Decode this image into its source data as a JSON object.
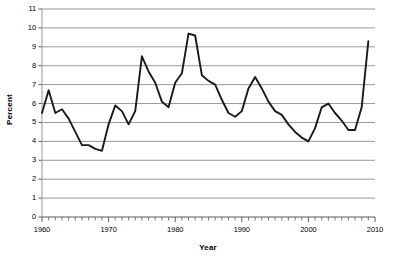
{
  "chart_data": {
    "type": "line",
    "title": "",
    "xlabel": "Year",
    "ylabel": "Percent",
    "xlim": [
      1960,
      2010
    ],
    "ylim": [
      0,
      11
    ],
    "grid": "horizontal",
    "legend": "none",
    "x_tick_labels": [
      "1960",
      "1970",
      "1980",
      "1990",
      "2000",
      "2010"
    ],
    "x_tick_values": [
      1960,
      1970,
      1980,
      1990,
      2000,
      2010
    ],
    "x_minor_tick_step": 1,
    "y_tick_labels": [
      "0",
      "1",
      "2",
      "3",
      "4",
      "5",
      "6",
      "7",
      "8",
      "9",
      "10",
      "11"
    ],
    "y_tick_values": [
      0,
      1,
      2,
      3,
      4,
      5,
      6,
      7,
      8,
      9,
      10,
      11
    ],
    "series": [
      {
        "name": "Percent",
        "color": "#1a1a1a",
        "x": [
          1960,
          1961,
          1962,
          1963,
          1964,
          1965,
          1966,
          1967,
          1968,
          1969,
          1970,
          1971,
          1972,
          1973,
          1974,
          1975,
          1976,
          1977,
          1978,
          1979,
          1980,
          1981,
          1982,
          1983,
          1984,
          1985,
          1986,
          1987,
          1988,
          1989,
          1990,
          1991,
          1992,
          1993,
          1994,
          1995,
          1996,
          1997,
          1998,
          1999,
          2000,
          2001,
          2002,
          2003,
          2004,
          2005,
          2006,
          2007,
          2008,
          2009
        ],
        "values": [
          5.5,
          6.7,
          5.5,
          5.7,
          5.2,
          4.5,
          3.8,
          3.8,
          3.6,
          3.5,
          4.9,
          5.9,
          5.6,
          4.9,
          5.6,
          8.5,
          7.7,
          7.1,
          6.1,
          5.8,
          7.1,
          7.6,
          9.7,
          9.6,
          7.5,
          7.2,
          7.0,
          6.2,
          5.5,
          5.3,
          5.6,
          6.8,
          7.4,
          6.8,
          6.1,
          5.6,
          5.4,
          4.9,
          4.5,
          4.2,
          4.0,
          4.7,
          5.8,
          6.0,
          5.5,
          5.1,
          4.6,
          4.6,
          5.8,
          9.3
        ]
      }
    ]
  }
}
